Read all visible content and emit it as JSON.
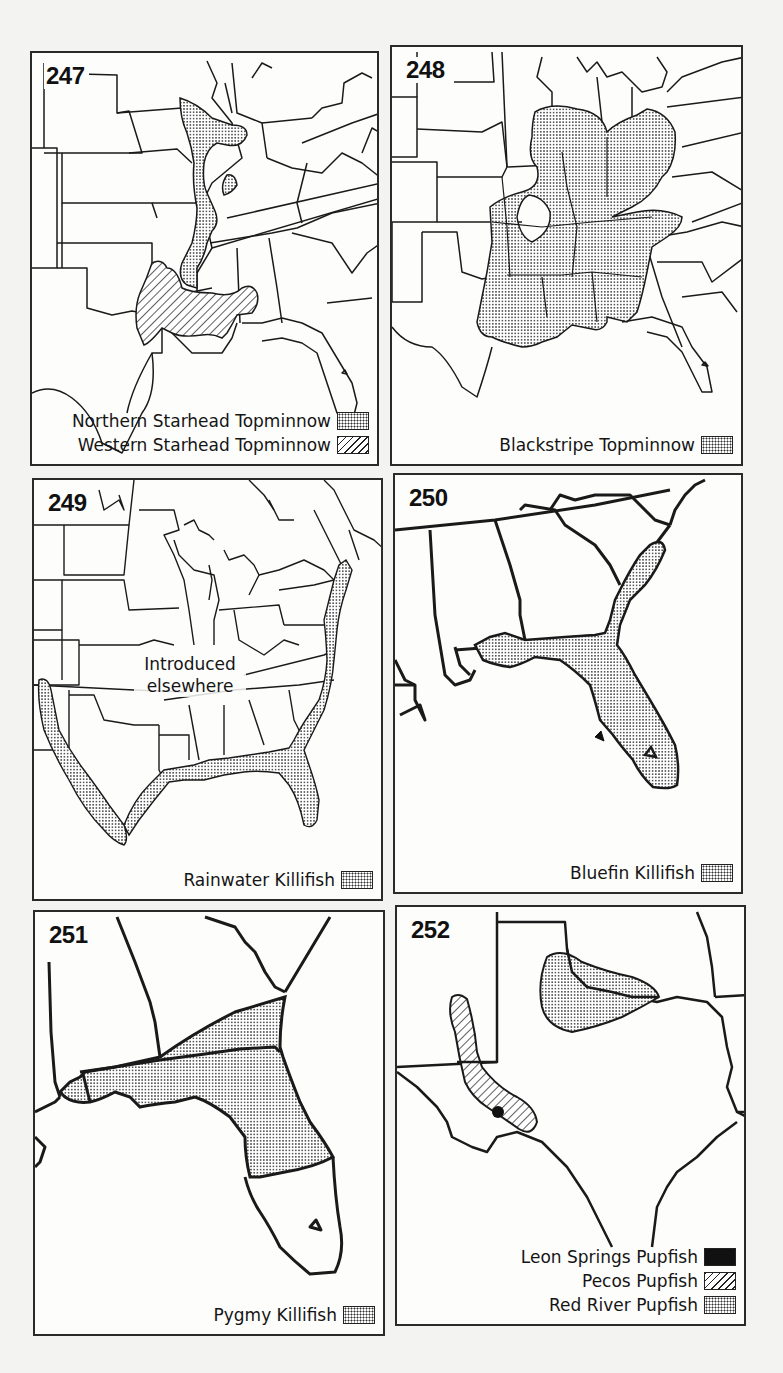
{
  "figures": [
    {
      "number": "247",
      "legend": [
        {
          "label": "Northern Starhead Topminnow",
          "pattern": "stipple"
        },
        {
          "label": "Western Starhead Topminnow",
          "pattern": "hatch"
        }
      ]
    },
    {
      "number": "248",
      "legend": [
        {
          "label": "Blackstripe Topminnow",
          "pattern": "stipple"
        }
      ]
    },
    {
      "number": "249",
      "annotation": [
        "Introduced",
        "elsewhere"
      ],
      "legend": [
        {
          "label": "Rainwater Killifish",
          "pattern": "stipple"
        }
      ]
    },
    {
      "number": "250",
      "legend": [
        {
          "label": "Bluefin Killifish",
          "pattern": "stipple"
        }
      ]
    },
    {
      "number": "251",
      "legend": [
        {
          "label": "Pygmy Killifish",
          "pattern": "stipple"
        }
      ]
    },
    {
      "number": "252",
      "legend": [
        {
          "label": "Leon Springs Pupfish",
          "pattern": "solid"
        },
        {
          "label": "Pecos Pupfish",
          "pattern": "hatch"
        },
        {
          "label": "Red River Pupfish",
          "pattern": "stipple"
        }
      ]
    }
  ],
  "colors": {
    "page_background": "#f3f3f1",
    "panel_background": "#fdfdfc",
    "line": "#1a1a1a",
    "fill_dark": "#111111"
  }
}
